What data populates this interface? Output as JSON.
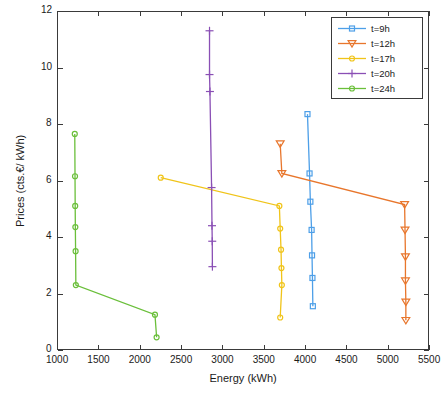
{
  "chart_data": {
    "type": "line",
    "title": "",
    "xlabel": "Energy (kWh)",
    "ylabel": "Prices (cts.€/ kWh)",
    "xlim": [
      1000,
      5500
    ],
    "ylim": [
      0,
      12
    ],
    "xticks": [
      "1000",
      "1500",
      "2000",
      "2500",
      "3000",
      "3500",
      "4000",
      "4500",
      "5000",
      "5500"
    ],
    "yticks": [
      "0",
      "2",
      "4",
      "6",
      "8",
      "10",
      "12"
    ],
    "grid": false,
    "legend_position": "top-right",
    "series": [
      {
        "name": "t=9h",
        "color": "#4d9fe8",
        "marker": "square",
        "points": [
          [
            4030,
            8.35
          ],
          [
            4055,
            6.25
          ],
          [
            4065,
            5.25
          ],
          [
            4080,
            4.25
          ],
          [
            4085,
            3.35
          ],
          [
            4090,
            2.55
          ],
          [
            4095,
            1.55
          ]
        ]
      },
      {
        "name": "t=12h",
        "color": "#e8762c",
        "marker": "triangle-down",
        "points": [
          [
            3700,
            7.3
          ],
          [
            3720,
            6.25
          ],
          [
            5205,
            5.15
          ],
          [
            5210,
            4.25
          ],
          [
            5215,
            3.3
          ],
          [
            5215,
            2.45
          ],
          [
            5220,
            1.7
          ],
          [
            5220,
            1.05
          ]
        ]
      },
      {
        "name": "t=17h",
        "color": "#f0c419",
        "marker": "circle",
        "points": [
          [
            2255,
            6.1
          ],
          [
            3690,
            5.1
          ],
          [
            3700,
            4.3
          ],
          [
            3710,
            3.55
          ],
          [
            3715,
            2.9
          ],
          [
            3720,
            2.3
          ],
          [
            3700,
            1.15
          ]
        ]
      },
      {
        "name": "t=20h",
        "color": "#8a4fb5",
        "marker": "plus",
        "points": [
          [
            2845,
            11.3
          ],
          [
            2845,
            9.75
          ],
          [
            2850,
            9.15
          ],
          [
            2870,
            5.75
          ],
          [
            2875,
            4.4
          ],
          [
            2878,
            3.85
          ],
          [
            2880,
            2.95
          ]
        ]
      },
      {
        "name": "t=24h",
        "color": "#6abf3a",
        "marker": "circle",
        "points": [
          [
            1215,
            7.65
          ],
          [
            1218,
            6.15
          ],
          [
            1220,
            5.1
          ],
          [
            1222,
            4.35
          ],
          [
            1225,
            3.5
          ],
          [
            1228,
            2.3
          ],
          [
            2185,
            1.25
          ],
          [
            2205,
            0.45
          ]
        ]
      }
    ]
  },
  "legend": {
    "entries": [
      {
        "label": "t=9h"
      },
      {
        "label": "t=12h"
      },
      {
        "label": "t=17h"
      },
      {
        "label": "t=20h"
      },
      {
        "label": "t=24h"
      }
    ]
  }
}
